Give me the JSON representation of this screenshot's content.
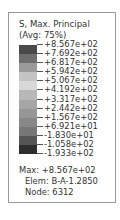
{
  "legend": {
    "title_line1": "S, Max. Principal",
    "title_line2": "(Avg: 75%)",
    "ticks": [
      "+8.567e+02",
      "+7.692e+02",
      "+6.817e+02",
      "+5.942e+02",
      "+5.067e+02",
      "+4.192e+02",
      "+3.317e+02",
      "+2.442e+02",
      "+1.567e+02",
      "+6.921e+01",
      "-1.830e+01",
      "-1.058e+02",
      "-1.933e+02"
    ],
    "band_colors": [
      "#4a4a4a",
      "#6e6e6e",
      "#9a9a9a",
      "#c4c4c4",
      "#d8d8d8",
      "#b8b8b8",
      "#a6a6a6",
      "#969696",
      "#888888",
      "#777777",
      "#555555",
      "#2e2e2e"
    ],
    "max_label": "Max: +8.567e+02",
    "elem_label": "Elem: B-A-1.2850",
    "node_label": "Node: 6312"
  }
}
